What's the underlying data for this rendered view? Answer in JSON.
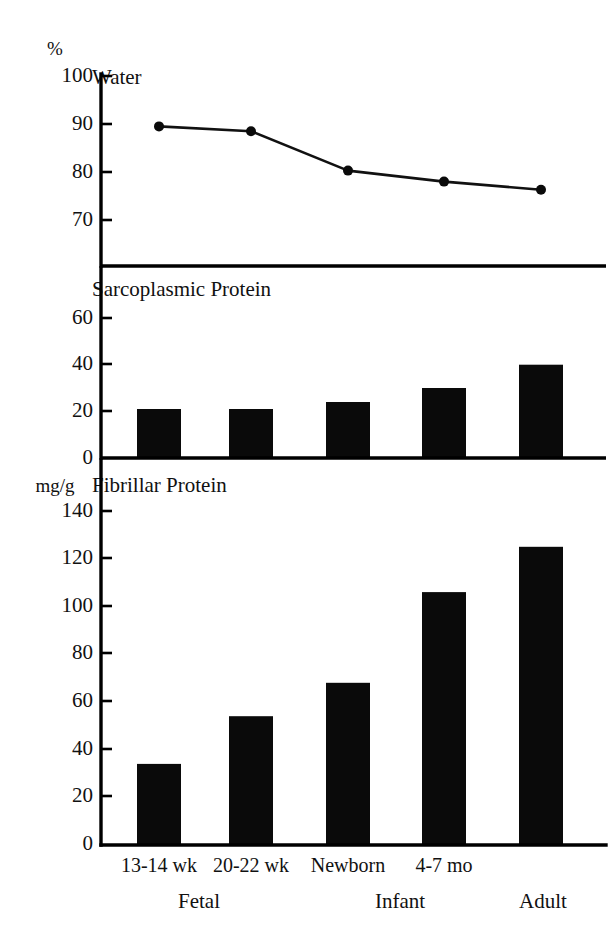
{
  "figure": {
    "background": "#ffffff",
    "ink_color": "#0a0a0a"
  },
  "categories": [
    "13-14 wk",
    "20-22 wk",
    "Newborn",
    "4-7 mo",
    ""
  ],
  "groups": [
    {
      "label": "Fetal"
    },
    {
      "label": "Infant"
    },
    {
      "label": "Adult"
    }
  ],
  "panels": {
    "water": {
      "title": "Water",
      "unit": "%",
      "ticks": [
        "100",
        "90",
        "80",
        "70"
      ]
    },
    "sarcoplasmic": {
      "title": "Sarcoplasmic Protein",
      "unit": "",
      "ticks": [
        "60",
        "40",
        "20",
        "0"
      ]
    },
    "fibrillar": {
      "title": "Fibrillar Protein",
      "unit": "mg/g",
      "ticks": [
        "140",
        "120",
        "100",
        "80",
        "60",
        "40",
        "20",
        "0"
      ]
    }
  },
  "chart_data": [
    {
      "type": "line",
      "title": "Water",
      "ylabel": "%",
      "xlabel": "",
      "categories": [
        "13-14 wk",
        "20-22 wk",
        "Newborn",
        "4-7 mo",
        "Adult"
      ],
      "values": [
        89.5,
        88.5,
        80.3,
        78.0,
        76.3
      ],
      "ylim": [
        65,
        100
      ],
      "yticks": [
        70,
        80,
        90,
        100
      ],
      "grid": false,
      "legend": "none",
      "markers": "filled-circle"
    },
    {
      "type": "bar",
      "title": "Sarcoplasmic Protein",
      "ylabel": "",
      "xlabel": "",
      "categories": [
        "13-14 wk",
        "20-22 wk",
        "Newborn",
        "4-7 mo",
        "Adult"
      ],
      "values": [
        21,
        21,
        24,
        30,
        40
      ],
      "ylim": [
        0,
        70
      ],
      "yticks": [
        0,
        20,
        40,
        60
      ],
      "grid": false,
      "legend": "none"
    },
    {
      "type": "bar",
      "title": "Fibrillar Protein",
      "ylabel": "mg/g",
      "xlabel": "",
      "categories": [
        "13-14 wk",
        "20-22 wk",
        "Newborn",
        "4-7 mo",
        "Adult"
      ],
      "values": [
        34,
        54,
        68,
        106,
        125
      ],
      "ylim": [
        0,
        150
      ],
      "yticks": [
        0,
        20,
        40,
        60,
        80,
        100,
        120,
        140
      ],
      "grid": false,
      "legend": "none"
    }
  ]
}
